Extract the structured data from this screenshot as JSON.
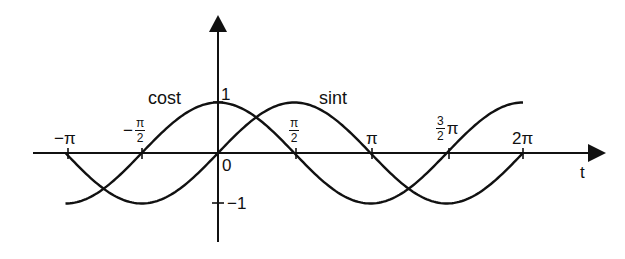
{
  "chart_data": {
    "type": "line",
    "title": "",
    "xlabel": "t",
    "ylabel": "",
    "xlim": [
      -3.14159,
      6.28318
    ],
    "ylim": [
      -1,
      1
    ],
    "grid": false,
    "legend": "inline curve labels",
    "x_ticks": [
      {
        "value": -3.14159,
        "label": "−π"
      },
      {
        "value": -1.5708,
        "label": "−π/2"
      },
      {
        "value": 0,
        "label": "0"
      },
      {
        "value": 1.5708,
        "label": "π/2"
      },
      {
        "value": 3.14159,
        "label": "π"
      },
      {
        "value": 4.71239,
        "label": "3/2 π"
      },
      {
        "value": 6.28318,
        "label": "2π"
      }
    ],
    "y_ticks": [
      {
        "value": 1,
        "label": "1"
      },
      {
        "value": -1,
        "label": "−1"
      }
    ],
    "series": [
      {
        "name": "cost",
        "function": "cos(t)",
        "t_range": [
          -3.14159,
          6.28318
        ],
        "x": [
          -3.14159,
          -1.5708,
          0,
          1.5708,
          3.14159,
          4.71239,
          6.28318
        ],
        "values": [
          -1,
          0,
          1,
          0,
          -1,
          0,
          1
        ]
      },
      {
        "name": "sint",
        "function": "sin(t)",
        "t_range": [
          -3.14159,
          6.28318
        ],
        "x": [
          -3.14159,
          -1.5708,
          0,
          1.5708,
          3.14159,
          4.71239,
          6.28318
        ],
        "values": [
          0,
          -1,
          0,
          1,
          0,
          -1,
          0
        ]
      }
    ],
    "annotations": [
      "cost",
      "sint",
      "t",
      "0",
      "1",
      "−1"
    ]
  },
  "labels": {
    "cos_curve": "cost",
    "sin_curve": "sint",
    "x_axis": "t",
    "origin": "0",
    "y_one": "1",
    "y_minus_one": "−1",
    "tick_neg_pi": "−π",
    "tick_neg_half_pi": {
      "sign": "−",
      "num": "π",
      "den": "2"
    },
    "tick_half_pi": {
      "num": "π",
      "den": "2"
    },
    "tick_pi": "π",
    "tick_three_half_pi": {
      "num": "3",
      "den": "2",
      "suffix": "π"
    },
    "tick_two_pi": "2π"
  },
  "colors": {
    "ink": "#111111",
    "background": "#ffffff"
  }
}
